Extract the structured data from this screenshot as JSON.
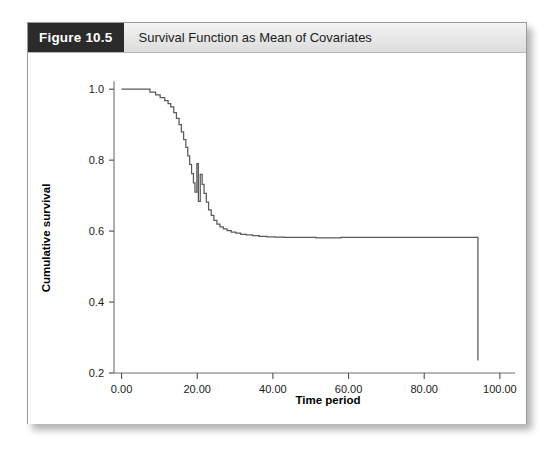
{
  "figure": {
    "number_label": "Figure 10.5",
    "title": "Survival Function as Mean of Covariates"
  },
  "chart_data": {
    "type": "line",
    "subtype": "kaplan-meier-step",
    "title": "Survival Function as Mean of Covariates",
    "xlabel": "Time period",
    "ylabel": "Cumulative survival",
    "xlim": [
      -2.0,
      104.0
    ],
    "ylim": [
      0.2,
      1.04
    ],
    "grid": false,
    "legend": null,
    "xticks": [
      0,
      20,
      40,
      60,
      80,
      100
    ],
    "xtick_labels": [
      "0.00",
      "20.00",
      "40.00",
      "60.00",
      "80.00",
      "100.00"
    ],
    "yticks": [
      0.2,
      0.4,
      0.6,
      0.8,
      1.0
    ],
    "ytick_labels": [
      "0.2",
      "0.4",
      "0.6",
      "0.8",
      "1.0"
    ],
    "series": [
      {
        "name": "Cumulative survival",
        "color": "#595959",
        "x": [
          0.0,
          6.0,
          7.5,
          9.0,
          10.2,
          11.4,
          12.3,
          13.0,
          13.8,
          14.5,
          15.2,
          15.8,
          16.4,
          17.0,
          17.5,
          18.0,
          18.5,
          19.0,
          19.4,
          19.9,
          20.3,
          20.8,
          21.3,
          21.8,
          22.4,
          23.0,
          23.7,
          24.4,
          25.2,
          26.0,
          26.9,
          27.9,
          29.0,
          30.2,
          31.5,
          33.0,
          34.6,
          36.4,
          38.4,
          40.6,
          43.0,
          45.6,
          48.4,
          51.4,
          54.6,
          58.0,
          94.2,
          94.2
        ],
        "y": [
          1.0,
          1.0,
          0.992,
          0.984,
          0.976,
          0.968,
          0.959,
          0.95,
          0.934,
          0.918,
          0.9,
          0.88,
          0.858,
          0.836,
          0.812,
          0.788,
          0.762,
          0.736,
          0.71,
          0.79,
          0.684,
          0.76,
          0.732,
          0.706,
          0.682,
          0.66,
          0.644,
          0.63,
          0.62,
          0.612,
          0.606,
          0.601,
          0.597,
          0.594,
          0.591,
          0.589,
          0.587,
          0.585,
          0.584,
          0.583,
          0.582,
          0.582,
          0.582,
          0.581,
          0.581,
          0.582,
          0.582,
          0.235
        ]
      }
    ],
    "annotations": {
      "plateau_value": 0.582,
      "terminal_time": 94.2,
      "terminal_value": 0.235,
      "start_value": 1.0
    }
  }
}
